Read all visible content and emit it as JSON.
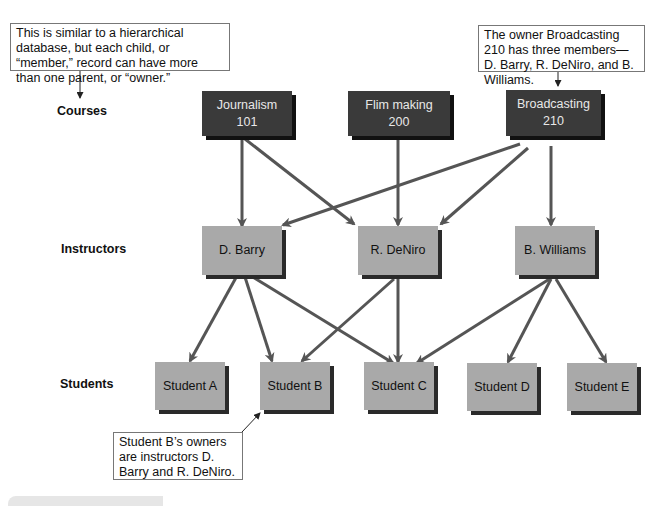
{
  "callouts": {
    "top_left": "This is similar to a hierarchical database, but each child, or “member,” record can have more than one parent, or “owner.”",
    "top_right": "The owner Broadcasting 210 has three members—D. Barry, R. DeNiro, and B. Williams.",
    "bottom": "Student B’s owners are instructors D. Barry and R. DeNiro."
  },
  "row_labels": {
    "courses": "Courses",
    "instructors": "Instructors",
    "students": "Students"
  },
  "courses": [
    {
      "line1": "Journalism",
      "line2": "101"
    },
    {
      "line1": "Flim making",
      "line2": "200"
    },
    {
      "line1": "Broadcasting",
      "line2": "210"
    }
  ],
  "instructors": [
    "D. Barry",
    "R. DeNiro",
    "B. Williams"
  ],
  "students": [
    "Student A",
    "Student B",
    "Student C",
    "Student D",
    "Student E"
  ],
  "relationships": [
    {
      "from": "Journalism 101",
      "to": "D. Barry"
    },
    {
      "from": "Journalism 101",
      "to": "R. DeNiro"
    },
    {
      "from": "Flim making 200",
      "to": "R. DeNiro"
    },
    {
      "from": "Broadcasting 210",
      "to": "D. Barry"
    },
    {
      "from": "Broadcasting 210",
      "to": "R. DeNiro"
    },
    {
      "from": "Broadcasting 210",
      "to": "B. Williams"
    },
    {
      "from": "D. Barry",
      "to": "Student A"
    },
    {
      "from": "D. Barry",
      "to": "Student B"
    },
    {
      "from": "D. Barry",
      "to": "Student C"
    },
    {
      "from": "R. DeNiro",
      "to": "Student B"
    },
    {
      "from": "R. DeNiro",
      "to": "Student C"
    },
    {
      "from": "B. Williams",
      "to": "Student C"
    },
    {
      "from": "B. Williams",
      "to": "Student D"
    },
    {
      "from": "B. Williams",
      "to": "Student E"
    }
  ],
  "colors": {
    "course_box": "#3a3a3a",
    "member_box": "#a9a9a9",
    "arrow": "#555555"
  }
}
